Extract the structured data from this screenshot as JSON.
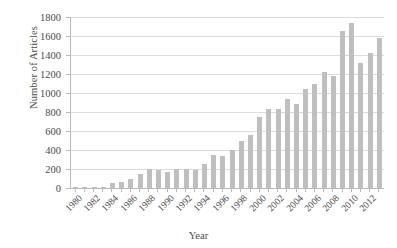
{
  "chart_data": {
    "type": "bar",
    "title": "",
    "xlabel": "Year",
    "ylabel": "Number of Articles",
    "ylim": [
      0,
      1800
    ],
    "yticks": [
      0,
      200,
      400,
      600,
      800,
      1000,
      1200,
      1400,
      1600,
      1800
    ],
    "ytick_labels": [
      "0",
      "200",
      "400",
      "600",
      "800",
      "1000",
      "1200",
      "1400",
      "1600",
      "1800"
    ],
    "xtick_labels": [
      "1980",
      "1982",
      "1984",
      "1986",
      "1988",
      "1990",
      "1992",
      "1994",
      "1996",
      "1998",
      "2000",
      "2002",
      "2004",
      "2006",
      "2008",
      "2010",
      "2012"
    ],
    "xtick_interval": 2,
    "grid": true,
    "legend": null,
    "bar_color": "#bfbfbf",
    "categories": [
      "1980",
      "1981",
      "1982",
      "1983",
      "1984",
      "1985",
      "1986",
      "1987",
      "1988",
      "1989",
      "1990",
      "1991",
      "1992",
      "1993",
      "1994",
      "1995",
      "1996",
      "1997",
      "1998",
      "1999",
      "2000",
      "2001",
      "2002",
      "2003",
      "2004",
      "2005",
      "2006",
      "2007",
      "2008",
      "2009",
      "2010",
      "2011",
      "2012",
      "2013"
    ],
    "values": [
      2,
      2,
      3,
      6,
      48,
      60,
      100,
      150,
      205,
      185,
      170,
      200,
      195,
      190,
      250,
      345,
      340,
      400,
      495,
      560,
      745,
      835,
      835,
      935,
      880,
      1040,
      1095,
      1220,
      1175,
      1650,
      1740,
      1320,
      1420,
      1580
    ]
  }
}
